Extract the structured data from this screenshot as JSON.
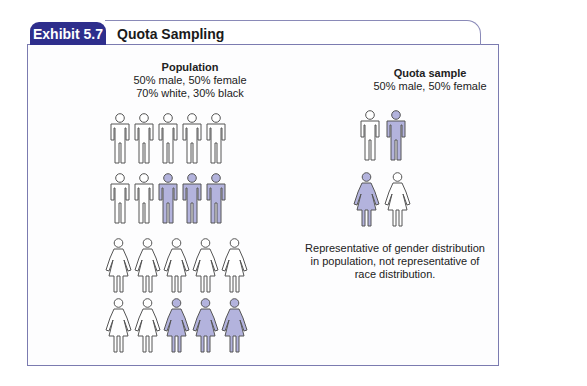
{
  "exhibit": {
    "tab_label": "Exhibit 5.7",
    "title": "Quota Sampling",
    "accent_color": "#2e2e8c",
    "border_color": "#7b7bb0"
  },
  "population": {
    "heading": "Population",
    "line1": "50% male, 50% female",
    "line2": "70% white, 30% black",
    "rows": [
      {
        "gender": "male",
        "figures": [
          "white",
          "white",
          "white",
          "white",
          "white"
        ]
      },
      {
        "gender": "male",
        "figures": [
          "white",
          "white",
          "black",
          "black",
          "black"
        ]
      },
      {
        "gender": "female",
        "figures": [
          "white",
          "white",
          "white",
          "white",
          "white"
        ]
      },
      {
        "gender": "female",
        "figures": [
          "white",
          "white",
          "black",
          "black",
          "black"
        ]
      }
    ]
  },
  "quota_sample": {
    "heading": "Quota sample",
    "line1": "50% male, 50% female",
    "rows": [
      {
        "gender": "male",
        "figures": [
          "white",
          "black"
        ]
      },
      {
        "gender": "female",
        "figures": [
          "black",
          "white"
        ]
      }
    ]
  },
  "note": {
    "line1": "Representative of gender distribution",
    "line2": "in population, not representative of",
    "line3": "race distribution."
  },
  "legend_colors": {
    "white": "#ffffff",
    "black": "#b3b3dd",
    "outline": "#555555"
  }
}
